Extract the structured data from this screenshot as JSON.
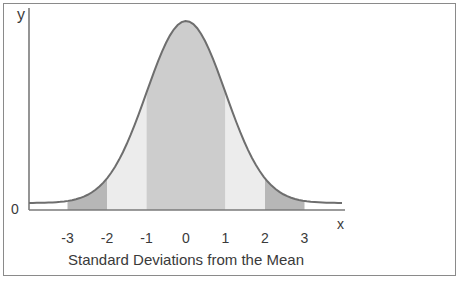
{
  "chart_data": {
    "type": "area",
    "title": "",
    "xlabel": "Standard Deviations from the Mean",
    "ylabel": "",
    "x_axis_letter": "x",
    "y_axis_letter": "y",
    "y_origin_label": "0",
    "x_ticks": [
      "-3",
      "-2",
      "-1",
      "0",
      "1",
      "2",
      "3"
    ],
    "x_tick_values": [
      -3,
      -2,
      -1,
      0,
      1,
      2,
      3
    ],
    "curve": "standard normal distribution (bell curve)",
    "shaded_regions": [
      {
        "from": -3,
        "to": -2,
        "shade": "dark"
      },
      {
        "from": -2,
        "to": -1,
        "shade": "light"
      },
      {
        "from": -1,
        "to": 1,
        "shade": "medium"
      },
      {
        "from": 1,
        "to": 2,
        "shade": "light"
      },
      {
        "from": 2,
        "to": 3,
        "shade": "dark"
      }
    ],
    "legend": null,
    "grid": false
  },
  "colors": {
    "frame": "#8a8a8a",
    "axis": "#7a7a7a",
    "curve": "#6e6e6e",
    "shade_dark": "#b7b7b7",
    "shade_medium": "#cdcdcd",
    "shade_light": "#ececec",
    "text": "#3a3a3a"
  }
}
